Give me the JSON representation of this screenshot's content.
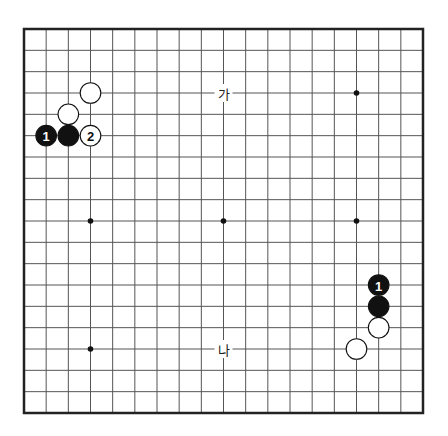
{
  "board": {
    "size": 19,
    "line_color": "#555555",
    "border_color": "#222222",
    "background": "#ffffff",
    "hoshi": [
      [
        3,
        3
      ],
      [
        9,
        3
      ],
      [
        15,
        3
      ],
      [
        3,
        9
      ],
      [
        9,
        9
      ],
      [
        15,
        9
      ],
      [
        3,
        15
      ],
      [
        9,
        15
      ],
      [
        15,
        15
      ]
    ]
  },
  "stones": [
    {
      "color": "white",
      "col": 3,
      "row": 3,
      "label": ""
    },
    {
      "color": "white",
      "col": 2,
      "row": 4,
      "label": ""
    },
    {
      "color": "black",
      "col": 1,
      "row": 5,
      "label": "1"
    },
    {
      "color": "black",
      "col": 2,
      "row": 5,
      "label": ""
    },
    {
      "color": "white",
      "col": 3,
      "row": 5,
      "label": "2"
    },
    {
      "color": "black",
      "col": 16,
      "row": 12,
      "label": "1"
    },
    {
      "color": "black",
      "col": 16,
      "row": 13,
      "label": ""
    },
    {
      "color": "white",
      "col": 16,
      "row": 14,
      "label": ""
    },
    {
      "color": "white",
      "col": 15,
      "row": 15,
      "label": ""
    }
  ],
  "markers": [
    {
      "text": "가",
      "col": 9,
      "row": 3
    },
    {
      "text": "나",
      "col": 9,
      "row": 15
    }
  ]
}
